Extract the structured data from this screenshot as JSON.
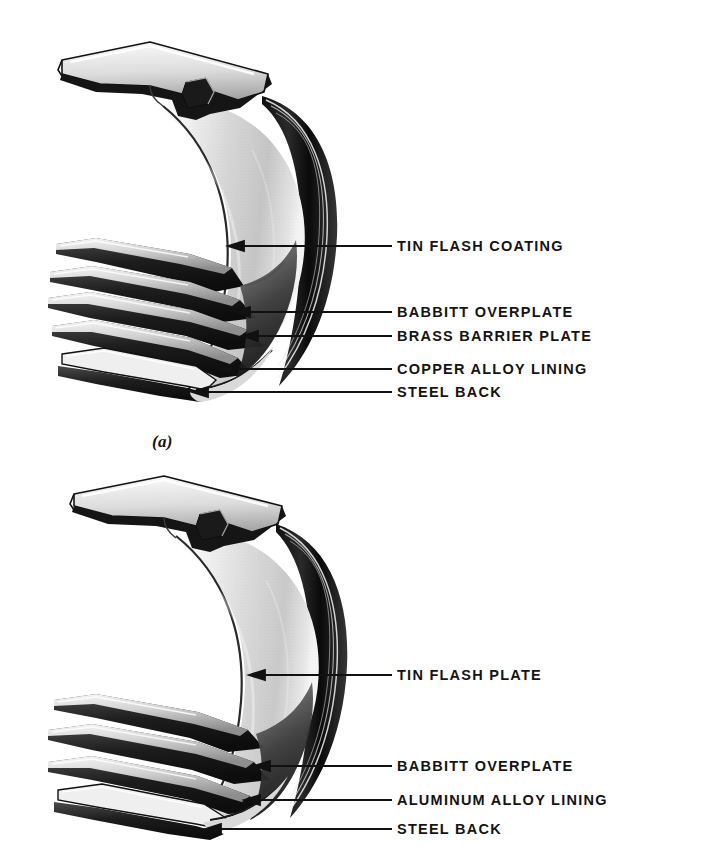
{
  "figure": {
    "background_color": "#ffffff",
    "ink_color": "#141414",
    "panels": [
      {
        "id": "panel-a",
        "caption": "(a)",
        "caption_x": 152,
        "caption_y": 432,
        "bearing_type": "copper-alloy trimetal bearing shell",
        "layer_count": 5,
        "labels": [
          {
            "text": "TIN FLASH COATING",
            "x": 397,
            "y": 246,
            "arrow_tip_x": 232,
            "arrow_tip_y": 246,
            "line_start_x": 392
          },
          {
            "text": "BABBITT OVERPLATE",
            "x": 397,
            "y": 312,
            "arrow_tip_x": 238,
            "arrow_tip_y": 312,
            "line_start_x": 392
          },
          {
            "text": "BRASS BARRIER PLATE",
            "x": 397,
            "y": 336,
            "arrow_tip_x": 246,
            "arrow_tip_y": 336,
            "line_start_x": 392
          },
          {
            "text": "COPPER ALLOY LINING",
            "x": 397,
            "y": 369,
            "arrow_tip_x": 222,
            "arrow_tip_y": 369,
            "line_start_x": 392
          },
          {
            "text": "STEEL BACK",
            "x": 397,
            "y": 392,
            "arrow_tip_x": 196,
            "arrow_tip_y": 392,
            "line_start_x": 392
          }
        ]
      },
      {
        "id": "panel-b",
        "caption": "",
        "bearing_type": "aluminum-alloy bearing shell",
        "layer_count": 4,
        "labels": [
          {
            "text": "TIN FLASH PLATE",
            "x": 397,
            "y": 675,
            "arrow_tip_x": 253,
            "arrow_tip_y": 675,
            "line_start_x": 392
          },
          {
            "text": "BABBITT OVERPLATE",
            "x": 397,
            "y": 766,
            "arrow_tip_x": 258,
            "arrow_tip_y": 766,
            "line_start_x": 392
          },
          {
            "text": "ALUMINUM ALLOY LINING",
            "x": 397,
            "y": 800,
            "arrow_tip_x": 248,
            "arrow_tip_y": 800,
            "line_start_x": 392
          },
          {
            "text": "STEEL BACK",
            "x": 397,
            "y": 829,
            "arrow_tip_x": 209,
            "arrow_tip_y": 829,
            "line_start_x": 392
          }
        ]
      }
    ]
  }
}
